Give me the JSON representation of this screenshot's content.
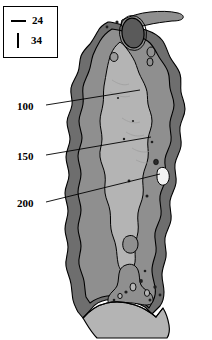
{
  "figure": {
    "type": "anatomical-cross-section",
    "background_color": "#ffffff",
    "outline_color": "#000000"
  },
  "legend": {
    "name": "scale-legend",
    "border_color": "#000000",
    "background_color": "#ffffff",
    "items": [
      {
        "marker": "horizontal-line",
        "label": "24"
      },
      {
        "marker": "vertical-line",
        "label": "34"
      }
    ]
  },
  "annotations": {
    "name": "depth-contour-labels",
    "items": [
      {
        "label": "100",
        "leader": true
      },
      {
        "label": "150",
        "leader": true
      },
      {
        "label": "200",
        "leader": true
      }
    ]
  },
  "regions": {
    "outer_band": {
      "name": "outer-dark-region",
      "color": "#6e6e6e"
    },
    "mid_band": {
      "name": "middle-gray-region",
      "color": "#8f8f8f"
    },
    "inner_core": {
      "name": "inner-light-channel",
      "color": "#b4b4b4"
    },
    "base": {
      "name": "basal-light-region",
      "color": "#b4b4b4"
    },
    "apex_cavity": {
      "name": "apex-dark-cavity",
      "color": "#5a5a5a"
    },
    "speckles": {
      "name": "dark-inclusions",
      "color": "#1f1f1f"
    }
  }
}
